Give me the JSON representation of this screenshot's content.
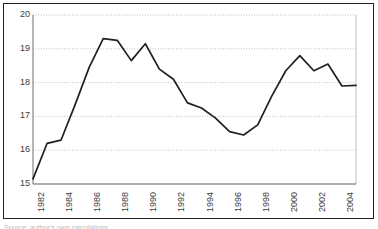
{
  "figure": {
    "background_color": "#ffffff",
    "frame_color": "#231f20",
    "line_color": "#231f20",
    "gridline_color": "#b0b0b0",
    "tick_label_color": "#3b3b3b",
    "caption_sliver": "Source: author's own calculations"
  },
  "axes": {
    "y_ticks": [
      "20",
      "19",
      "18",
      "17",
      "16",
      "15"
    ],
    "x_ticks": [
      "1982",
      "1984",
      "1986",
      "1988",
      "1990",
      "1992",
      "1994",
      "1996",
      "1998",
      "2000",
      "2002",
      "2004"
    ]
  },
  "chart_data": {
    "type": "line",
    "title": "",
    "subtitle": "",
    "xlabel": "",
    "ylabel": "",
    "xlim": [
      1982,
      2005
    ],
    "ylim": [
      15,
      20
    ],
    "ytick_values": [
      20,
      19,
      18,
      17,
      16,
      15
    ],
    "xtick_values": [
      1982,
      1984,
      1986,
      1988,
      1990,
      1992,
      1994,
      1996,
      1998,
      2000,
      2002,
      2004
    ],
    "grid": true,
    "grid_style": "dotted-horizontal",
    "legend": false,
    "legend_position": "none",
    "x": [
      1982,
      1983,
      1984,
      1985,
      1986,
      1987,
      1988,
      1989,
      1990,
      1991,
      1992,
      1993,
      1994,
      1995,
      1996,
      1997,
      1998,
      1999,
      2000,
      2001,
      2002,
      2003,
      2004,
      2005
    ],
    "series": [
      {
        "name": "series-1",
        "color": "#231f20",
        "values": [
          15.15,
          16.2,
          16.3,
          17.35,
          18.45,
          19.3,
          19.25,
          18.65,
          19.15,
          18.4,
          18.1,
          17.4,
          17.25,
          16.95,
          16.55,
          16.45,
          16.75,
          17.6,
          18.35,
          18.8,
          18.35,
          18.55,
          17.9,
          17.92
        ]
      }
    ]
  }
}
